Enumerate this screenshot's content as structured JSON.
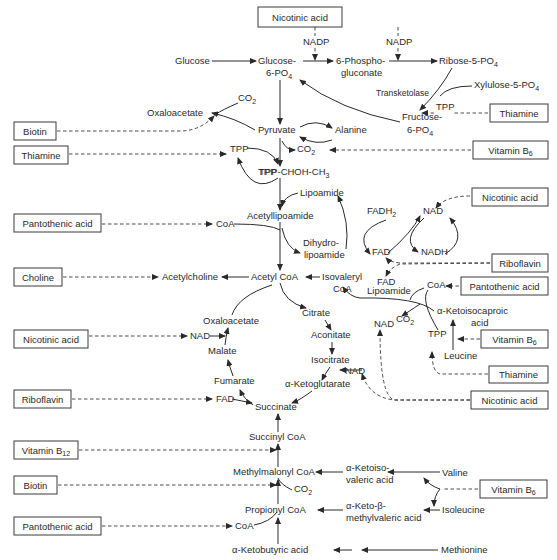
{
  "vitamin_boxes": [
    {
      "id": "nicotinic-top",
      "label": "Nicotinic acid",
      "x": 258,
      "y": 7,
      "w": 84,
      "h": 20
    },
    {
      "id": "thiamine-ppp",
      "label": "Thiamine",
      "x": 490,
      "y": 104,
      "w": 58,
      "h": 18
    },
    {
      "id": "biotin-1",
      "label": "Biotin",
      "x": 14,
      "y": 122,
      "w": 42,
      "h": 18
    },
    {
      "id": "thiamine-pdh",
      "label": "Thiamine",
      "x": 14,
      "y": 146,
      "w": 54,
      "h": 18
    },
    {
      "id": "vitamin-b6-1",
      "label": "Vitamin B6",
      "x": 473,
      "y": 141,
      "w": 75,
      "h": 18
    },
    {
      "id": "nicotinic-pdh",
      "label": "Nicotinic acid",
      "x": 472,
      "y": 188,
      "w": 76,
      "h": 18
    },
    {
      "id": "pantothenic-1",
      "label": "Pantothenic acid",
      "x": 14,
      "y": 214,
      "w": 87,
      "h": 18
    },
    {
      "id": "riboflavin-1",
      "label": "Riboflavin",
      "x": 492,
      "y": 254,
      "w": 56,
      "h": 18
    },
    {
      "id": "choline",
      "label": "Choline",
      "x": 14,
      "y": 268,
      "w": 48,
      "h": 18
    },
    {
      "id": "pantothenic-2",
      "label": "Pantothenic acid",
      "x": 461,
      "y": 277,
      "w": 87,
      "h": 18
    },
    {
      "id": "nicotinic-tca",
      "label": "Nicotinic acid",
      "x": 14,
      "y": 330,
      "w": 74,
      "h": 18
    },
    {
      "id": "vitamin-b6-2",
      "label": "Vitamin B6",
      "x": 481,
      "y": 330,
      "w": 67,
      "h": 18
    },
    {
      "id": "thiamine-leu",
      "label": "Thiamine",
      "x": 489,
      "y": 366,
      "w": 59,
      "h": 17
    },
    {
      "id": "riboflavin-2",
      "label": "Riboflavin",
      "x": 14,
      "y": 390,
      "w": 57,
      "h": 18
    },
    {
      "id": "nicotinic-kg",
      "label": "Nicotinic acid",
      "x": 471,
      "y": 391,
      "w": 77,
      "h": 18
    },
    {
      "id": "vitamin-b12",
      "label": "Vitamin B12",
      "x": 14,
      "y": 441,
      "w": 64,
      "h": 18
    },
    {
      "id": "biotin-2",
      "label": "Biotin",
      "x": 14,
      "y": 476,
      "w": 43,
      "h": 18
    },
    {
      "id": "vitamin-b6-3",
      "label": "Vitamin B6",
      "x": 480,
      "y": 480,
      "w": 67,
      "h": 18
    },
    {
      "id": "pantothenic-3",
      "label": "Pantothenic acid",
      "x": 14,
      "y": 517,
      "w": 87,
      "h": 18
    }
  ],
  "metabolites": [
    {
      "label": "Glucose",
      "x": 175,
      "y": 64,
      "anchor": "start"
    },
    {
      "label": "Glucose-",
      "x": 258,
      "y": 64,
      "anchor": "start"
    },
    {
      "label": "6-PO4",
      "x": 266,
      "y": 76,
      "anchor": "start"
    },
    {
      "label": "6-Phospho-",
      "x": 336,
      "y": 64,
      "anchor": "start"
    },
    {
      "label": "gluconate",
      "x": 341,
      "y": 76,
      "anchor": "start"
    },
    {
      "label": "Ribose-5-PO4",
      "x": 439,
      "y": 64,
      "anchor": "start"
    },
    {
      "label": "Xylulose-5-PO4",
      "x": 474,
      "y": 88,
      "anchor": "start"
    },
    {
      "label": "Fructose-",
      "x": 402,
      "y": 120,
      "anchor": "start"
    },
    {
      "label": "6-PO4",
      "x": 407,
      "y": 133,
      "anchor": "start"
    },
    {
      "label": "Oxaloacetate",
      "x": 147,
      "y": 116,
      "anchor": "start"
    },
    {
      "label": "Pyruvate",
      "x": 258,
      "y": 133,
      "anchor": "start"
    },
    {
      "label": "Alanine",
      "x": 335,
      "y": 133,
      "anchor": "start"
    },
    {
      "label": "TPP-CHOH-CH3",
      "x": 259,
      "y": 175,
      "anchor": "start"
    },
    {
      "label": "Lipoamide",
      "x": 300,
      "y": 196,
      "anchor": "start"
    },
    {
      "label": "Acetyllipoamide",
      "x": 247,
      "y": 219,
      "anchor": "start"
    },
    {
      "label": "Dihydro-",
      "x": 303,
      "y": 246,
      "anchor": "start"
    },
    {
      "label": "lipoamide",
      "x": 304,
      "y": 258,
      "anchor": "start"
    },
    {
      "label": "Acetylcholine",
      "x": 162,
      "y": 280,
      "anchor": "start"
    },
    {
      "label": "Acetyl CoA",
      "x": 251,
      "y": 280,
      "anchor": "start"
    },
    {
      "label": "Isovaleryl",
      "x": 322,
      "y": 280,
      "anchor": "start"
    },
    {
      "label": "CoA",
      "x": 333,
      "y": 292,
      "anchor": "start"
    },
    {
      "label": "Citrate",
      "x": 302,
      "y": 316,
      "anchor": "start"
    },
    {
      "label": "Oxaloacetate",
      "x": 203,
      "y": 324,
      "anchor": "start"
    },
    {
      "label": "Aconitate",
      "x": 311,
      "y": 338,
      "anchor": "start"
    },
    {
      "label": "Malate",
      "x": 208,
      "y": 354,
      "anchor": "start"
    },
    {
      "label": "Isocitrate",
      "x": 311,
      "y": 363,
      "anchor": "start"
    },
    {
      "label": "Fumarate",
      "x": 214,
      "y": 384,
      "anchor": "start"
    },
    {
      "label": "α-Ketoglutarate",
      "x": 285,
      "y": 387,
      "anchor": "start"
    },
    {
      "label": "Succinate",
      "x": 255,
      "y": 410,
      "anchor": "start"
    },
    {
      "label": "α-Ketoisocaproic",
      "x": 437,
      "y": 314,
      "anchor": "start"
    },
    {
      "label": "acid",
      "x": 471,
      "y": 326,
      "anchor": "start"
    },
    {
      "label": "Leucine",
      "x": 444,
      "y": 359,
      "anchor": "start"
    },
    {
      "label": "Succinyl CoA",
      "x": 249,
      "y": 440,
      "anchor": "start"
    },
    {
      "label": "Methylmalonyl CoA",
      "x": 233,
      "y": 475,
      "anchor": "start"
    },
    {
      "label": "α-Ketoiso-",
      "x": 346,
      "y": 471,
      "anchor": "start"
    },
    {
      "label": "valeric acid",
      "x": 346,
      "y": 483,
      "anchor": "start"
    },
    {
      "label": "Valine",
      "x": 442,
      "y": 476,
      "anchor": "start"
    },
    {
      "label": "Propionyl CoA",
      "x": 245,
      "y": 513,
      "anchor": "start"
    },
    {
      "label": "α-Keto-β-",
      "x": 346,
      "y": 509,
      "anchor": "start"
    },
    {
      "label": "methylvaleric acid",
      "x": 346,
      "y": 521,
      "anchor": "start"
    },
    {
      "label": "Isoleucine",
      "x": 442,
      "y": 513,
      "anchor": "start"
    },
    {
      "label": "α-Ketobutyric acid",
      "x": 232,
      "y": 553,
      "anchor": "start"
    },
    {
      "label": "Methionine",
      "x": 441,
      "y": 553,
      "anchor": "start"
    }
  ],
  "cofactors": [
    {
      "label": "NADP",
      "x": 303,
      "y": 45
    },
    {
      "label": "NADP",
      "x": 386,
      "y": 45
    },
    {
      "label": "Transketolase",
      "x": 376,
      "y": 96
    },
    {
      "label": "TPP",
      "x": 436,
      "y": 110
    },
    {
      "label": "CO2",
      "x": 238,
      "y": 101
    },
    {
      "label": "TPP",
      "x": 230,
      "y": 152
    },
    {
      "label": "TPP",
      "x": 258,
      "y": 175
    },
    {
      "label": "CO2",
      "x": 297,
      "y": 152
    },
    {
      "label": "CoA",
      "x": 216,
      "y": 227
    },
    {
      "label": "FADH2",
      "x": 367,
      "y": 214
    },
    {
      "label": "NAD",
      "x": 423,
      "y": 214
    },
    {
      "label": "FAD",
      "x": 372,
      "y": 255
    },
    {
      "label": "NADH",
      "x": 421,
      "y": 255
    },
    {
      "label": "FAD",
      "x": 377,
      "y": 285
    },
    {
      "label": "Lipoamide",
      "x": 367,
      "y": 294
    },
    {
      "label": "CoA",
      "x": 427,
      "y": 288
    },
    {
      "label": "CO2",
      "x": 396,
      "y": 322
    },
    {
      "label": "NAD",
      "x": 374,
      "y": 327
    },
    {
      "label": "TPP",
      "x": 428,
      "y": 337
    },
    {
      "label": "NAD",
      "x": 190,
      "y": 339
    },
    {
      "label": "NAD",
      "x": 345,
      "y": 374
    },
    {
      "label": "FAD",
      "x": 216,
      "y": 402
    },
    {
      "label": "CO2",
      "x": 294,
      "y": 492
    },
    {
      "label": "CoA",
      "x": 235,
      "y": 529
    }
  ],
  "colors": {
    "ink": "#2a2a2a",
    "box_border": "#3a3a3a",
    "background": "#ffffff"
  }
}
